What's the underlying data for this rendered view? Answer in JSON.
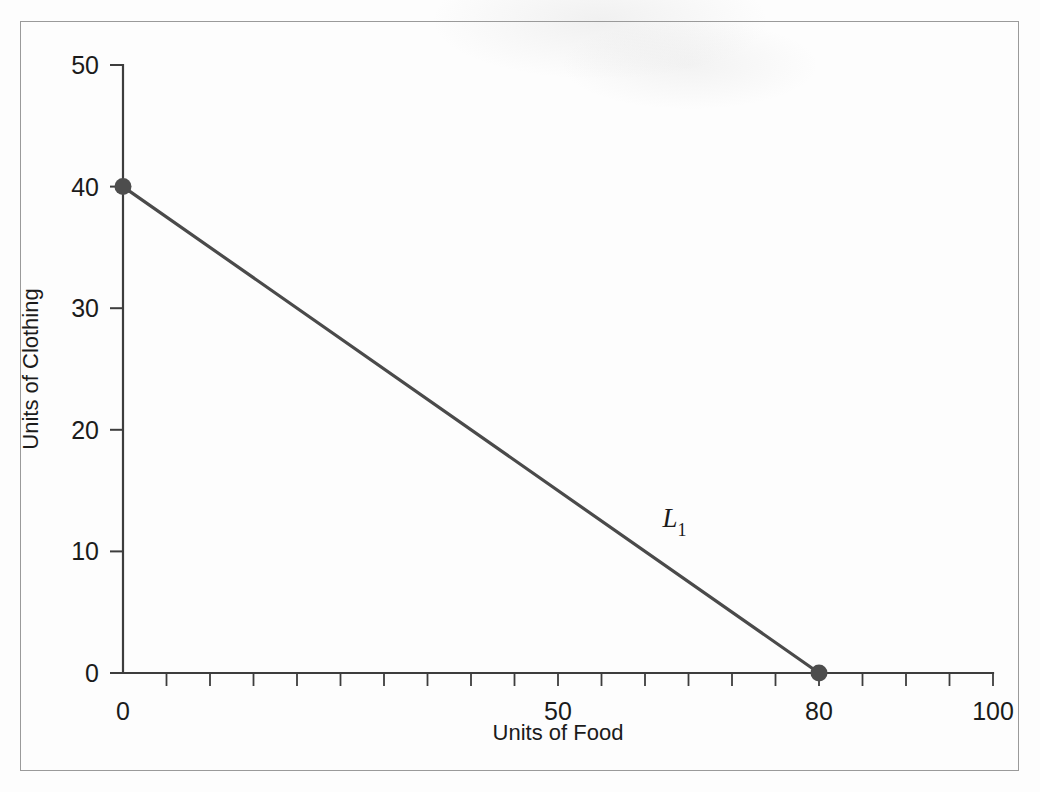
{
  "figure": {
    "background_color": "#fdfdfd",
    "border_color": "#9a9a9a",
    "line_color": "#4a4a4a",
    "marker_color": "#4d4d4d",
    "text_color": "#1b1b1b"
  },
  "chart_data": {
    "type": "line",
    "title": "",
    "xlabel": "Units of Food",
    "ylabel": "Units of Clothing",
    "xlim": [
      0,
      100
    ],
    "ylim": [
      0,
      50
    ],
    "grid": false,
    "legend": "none",
    "x_tick_labels": [
      "0",
      "50",
      "80",
      "100"
    ],
    "x_tick_values": [
      0,
      50,
      80,
      100
    ],
    "x_minor_tick_step": 5,
    "y_tick_labels": [
      "0",
      "10",
      "20",
      "30",
      "40",
      "50"
    ],
    "y_tick_values": [
      0,
      10,
      20,
      30,
      40,
      50
    ],
    "series": [
      {
        "name": "L1",
        "annotation": "L",
        "annotation_subscript": "1",
        "annotation_x": 62,
        "annotation_y": 12,
        "x": [
          0,
          80
        ],
        "y": [
          40,
          0
        ],
        "markers": [
          {
            "x": 0,
            "y": 40
          },
          {
            "x": 80,
            "y": 0
          }
        ]
      }
    ]
  }
}
